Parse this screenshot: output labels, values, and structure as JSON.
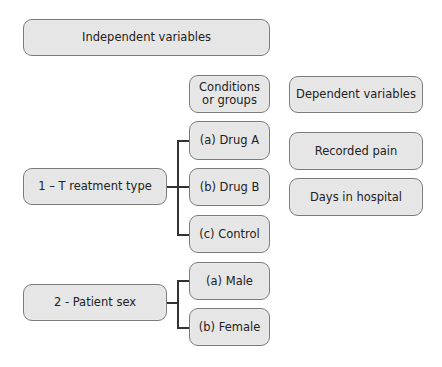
{
  "diagram": {
    "header_independent": "Independent variables",
    "header_conditions": "Conditions\nor groups",
    "header_dependent": "Dependent variables",
    "independent_variables": [
      {
        "label": "1 – T reatment type",
        "conditions": [
          "(a) Drug A",
          "(b) Drug B",
          "(c) Control"
        ]
      },
      {
        "label": "2 - Patient sex",
        "conditions": [
          "(a) Male",
          "(b) Female"
        ]
      }
    ],
    "dependent_variables": [
      "Recorded pain",
      "Days in hospital"
    ],
    "colors": {
      "box_fill": "#e6e6e6",
      "box_border": "#7a7a7a",
      "text": "#222222",
      "connector": "#333333"
    }
  }
}
